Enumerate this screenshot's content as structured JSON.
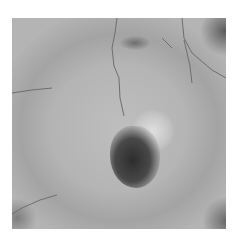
{
  "image": {
    "kind": "grayscale fundus photograph",
    "subject": "retina with central dark lesion adjacent to pale patch",
    "colors": {
      "background": "#b4b4b4",
      "lesion_dark": "#3c3c3c",
      "pale_patch": "#d8d8d8",
      "vessel": "#6e6e6e",
      "border": "#ffffff"
    }
  }
}
